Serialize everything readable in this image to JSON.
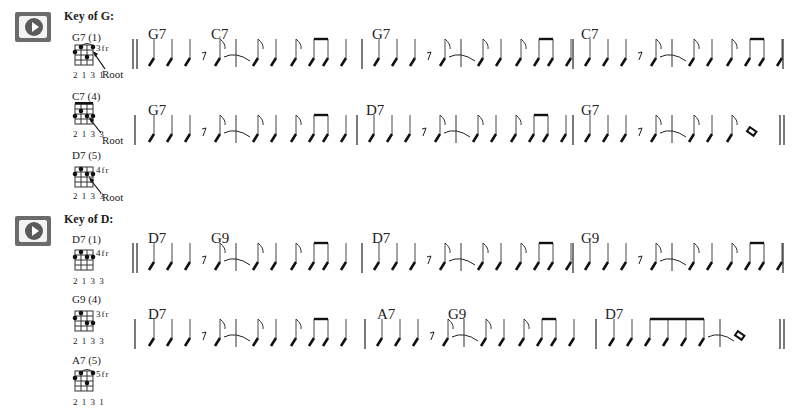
{
  "sections": [
    {
      "key_title": "Key of G:",
      "play_button": {
        "label": "play-audio",
        "icon": "play-icon"
      },
      "chord_diagrams": [
        {
          "name": "G7 (1)",
          "fingering": "2 1 3 1",
          "fret": "3fr",
          "root_label": "Root"
        },
        {
          "name": "C7 (4)",
          "fingering": "2 1 3 3",
          "fret": "",
          "root_label": "Root"
        },
        {
          "name": "D7 (5)",
          "fingering": "2 1 3 3",
          "fret": "4fr",
          "root_label": "Root"
        }
      ],
      "systems": [
        {
          "chords": [
            "G7",
            "C7",
            "G7",
            "C7"
          ]
        },
        {
          "chords": [
            "G7",
            "D7",
            "G7"
          ]
        }
      ]
    },
    {
      "key_title": "Key of D:",
      "play_button": {
        "label": "play-audio",
        "icon": "play-icon"
      },
      "chord_diagrams": [
        {
          "name": "D7 (1)",
          "fingering": "2 1 3 3",
          "fret": "4fr",
          "root_label": ""
        },
        {
          "name": "G9 (4)",
          "fingering": "2 1 3 3",
          "fret": "3fr",
          "root_label": ""
        },
        {
          "name": "A7 (5)",
          "fingering": "2 1 3 1",
          "fret": "5fr",
          "root_label": ""
        }
      ],
      "systems": [
        {
          "chords": [
            "D7",
            "G9",
            "D7",
            "G9"
          ]
        },
        {
          "chords": [
            "D7",
            "A7",
            "G9",
            "D7"
          ]
        }
      ]
    }
  ]
}
